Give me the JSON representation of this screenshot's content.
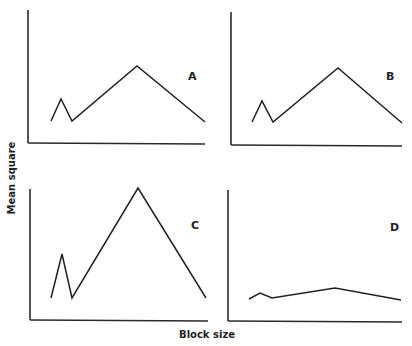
{
  "chart_data": [
    {
      "type": "line",
      "panel": "A",
      "x": [
        1,
        2,
        3,
        4,
        5
      ],
      "values": [
        0.25,
        0.45,
        0.25,
        0.75,
        0.25
      ],
      "xlabel": "Block size",
      "ylabel": "Mean square",
      "ylim": [
        0,
        1
      ],
      "grid": false,
      "ticks": false
    },
    {
      "type": "line",
      "panel": "B",
      "x": [
        1,
        2,
        3,
        4,
        5
      ],
      "values": [
        0.25,
        0.45,
        0.25,
        0.75,
        0.25
      ],
      "xlabel": "Block size",
      "ylabel": "Mean square",
      "ylim": [
        0,
        1
      ],
      "grid": false,
      "ticks": false
    },
    {
      "type": "line",
      "panel": "C",
      "x": [
        1,
        2,
        3,
        4,
        5
      ],
      "values": [
        0.18,
        0.5,
        0.18,
        1.0,
        0.18
      ],
      "xlabel": "Block size",
      "ylabel": "Mean square",
      "ylim": [
        0,
        1
      ],
      "grid": false,
      "ticks": false
    },
    {
      "type": "line",
      "panel": "D",
      "x": [
        1,
        2,
        3,
        4,
        5
      ],
      "values": [
        0.17,
        0.21,
        0.17,
        0.25,
        0.16
      ],
      "xlabel": "Block size",
      "ylabel": "Mean square",
      "ylim": [
        0,
        1
      ],
      "grid": false,
      "ticks": false
    }
  ],
  "figure": {
    "xlabel": "Block size",
    "ylabel": "Mean square",
    "panels": [
      {
        "label": "A",
        "yaxis": "28,10 28,143",
        "xaxis": "28,143 205,144",
        "points": "51,121 61,99 72,121 137,66 205,122",
        "label_x": 188,
        "label_y": 80
      },
      {
        "label": "B",
        "yaxis": "231,12 231,145",
        "xaxis": "231,145 402,146",
        "points": "252,122 262,101 273,122 338,68 402,123",
        "label_x": 386,
        "label_y": 80
      },
      {
        "label": "C",
        "yaxis": "30,189 30,320",
        "xaxis": "30,320 208,321",
        "points": "51,298 62,254 72,298 138,188 206,298",
        "label_x": 191,
        "label_y": 229
      },
      {
        "label": "D",
        "yaxis": "228,190 228,321",
        "xaxis": "228,321 402,322",
        "points": "249,299 260,293 272,298 335,288 401,300",
        "label_x": 390,
        "label_y": 231
      }
    ]
  }
}
